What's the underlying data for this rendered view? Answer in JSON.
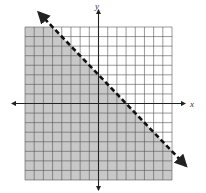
{
  "chart_data": {
    "type": "line",
    "title": "",
    "xlabel": "x",
    "ylabel": "y",
    "xlim": [
      -8,
      8
    ],
    "ylim": [
      -8,
      8
    ],
    "grid": true,
    "grid_step": 1,
    "legend": null,
    "boundary_line": {
      "equation": "y = -x + 3",
      "slope": -1,
      "intercept": 3,
      "style": "dashed",
      "points": [
        [
          -8,
          11
        ],
        [
          8,
          -5
        ]
      ]
    },
    "inequality": "y < -x + 3",
    "shaded_region": "below",
    "colors": {
      "shade": "#c8c8c8",
      "grid": "#555555",
      "line": "#111111",
      "axis": "#222222"
    }
  },
  "labels": {
    "x_axis": "x",
    "y_axis": "y"
  }
}
